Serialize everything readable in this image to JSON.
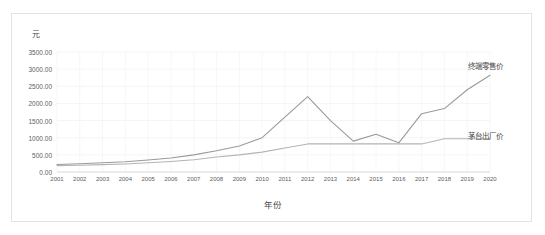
{
  "chart_data": {
    "type": "line",
    "title": "",
    "xlabel": "年份",
    "ylabel": "元",
    "ylim": [
      0,
      3500
    ],
    "ytick_values": [
      0,
      500,
      1000,
      1500,
      2000,
      2500,
      3000,
      3500
    ],
    "ytick_labels": [
      "0.00",
      "500.00",
      "1000.00",
      "1500.00",
      "2000.00",
      "2500.00",
      "3000.00",
      "3500.00"
    ],
    "grid": true,
    "legend_position": "inline-right",
    "categories": [
      "2001",
      "2002",
      "2003",
      "2004",
      "2005",
      "2006",
      "2007",
      "2008",
      "2009",
      "2010",
      "2011",
      "2012",
      "2013",
      "2014",
      "2015",
      "2016",
      "2017",
      "2018",
      "2019",
      "2020"
    ],
    "series": [
      {
        "name": "终端零售价",
        "color": "#9a9a9a",
        "values": [
          218,
          240,
          268,
          300,
          350,
          410,
          500,
          620,
          760,
          1000,
          1600,
          2200,
          1500,
          900,
          1100,
          850,
          1700,
          1850,
          2400,
          2820
        ]
      },
      {
        "name": "茅台出厂价",
        "color": "#b4b4b4",
        "values": [
          185,
          198,
          215,
          235,
          268,
          308,
          358,
          438,
          500,
          580,
          700,
          819,
          819,
          819,
          819,
          819,
          819,
          969,
          969,
          969
        ]
      }
    ]
  },
  "axes": {
    "y_title": "元",
    "x_title": "年份"
  },
  "series_labels": {
    "retail": "终端零售价",
    "factory": "茅台出厂价"
  },
  "colors": {
    "frame_border": "#e2e3e5",
    "grid": "#f2f2f4",
    "axis_line": "#d4d4d6",
    "tick_text": "#606060",
    "retail_line": "#9a9a9a",
    "factory_line": "#b4b4b4",
    "background": "#ffffff"
  }
}
